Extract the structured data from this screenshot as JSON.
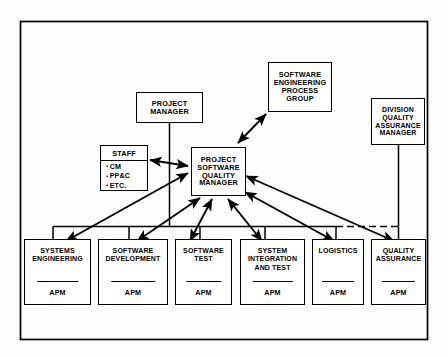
{
  "diagram": {
    "frame": {
      "stroke": "#000000",
      "background": "#fdfdfb"
    },
    "nodes": {
      "project_manager": {
        "label": "PROJECT MANAGER",
        "lines": [
          "PROJECT",
          "MANAGER"
        ]
      },
      "sepg": {
        "label": "SOFTWARE ENGINEERING PROCESS GROUP",
        "lines": [
          "SOFTWARE",
          "ENGINEERING",
          "PROCESS",
          "GROUP"
        ]
      },
      "division_qa": {
        "label": "DIVISION QUALITY ASSURANCE MANAGER",
        "lines": [
          "DIVISION",
          "QUALITY",
          "ASSURANCE",
          "MANAGER"
        ]
      },
      "staff": {
        "title": "STAFF",
        "items": [
          "CM",
          "PP&C",
          "ETC."
        ],
        "bullet": "•"
      },
      "psqm": {
        "label": "PROJECT SOFTWARE QUALITY MANAGER",
        "lines": [
          "PROJECT",
          "SOFTWARE",
          "QUALITY",
          "MANAGER"
        ]
      }
    },
    "leaves": [
      {
        "id": "systems-engineering",
        "lines": [
          "SYSTEMS",
          "ENGINEERING"
        ],
        "role": "APM"
      },
      {
        "id": "software-development",
        "lines": [
          "SOFTWARE",
          "DEVELOPMENT"
        ],
        "role": "APM"
      },
      {
        "id": "software-test",
        "lines": [
          "SOFTWARE",
          "TEST"
        ],
        "role": "APM"
      },
      {
        "id": "system-integration",
        "lines": [
          "SYSTEM",
          "INTEGRATION",
          "AND  TEST"
        ],
        "role": "APM"
      },
      {
        "id": "logistics",
        "lines": [
          "LOGISTICS"
        ],
        "role": "APM"
      },
      {
        "id": "quality-assurance",
        "lines": [
          "QUALITY",
          "ASSURANCE"
        ],
        "role": "APM"
      }
    ],
    "connectors": {
      "bus_style": "solid-with-dashed-right-segment",
      "arrow_style": "double-headed",
      "links": [
        {
          "from": "project_manager",
          "to": "org-bus",
          "type": "line"
        },
        {
          "from": "division_qa",
          "to": "org-bus",
          "type": "line"
        },
        {
          "from": "psqm",
          "to": "sepg",
          "type": "double-arrow"
        },
        {
          "from": "psqm",
          "to": "staff",
          "type": "double-arrow"
        },
        {
          "from": "psqm",
          "to": "systems-engineering",
          "type": "double-arrow"
        },
        {
          "from": "psqm",
          "to": "software-development",
          "type": "double-arrow"
        },
        {
          "from": "psqm",
          "to": "software-test",
          "type": "double-arrow"
        },
        {
          "from": "psqm",
          "to": "system-integration",
          "type": "double-arrow"
        },
        {
          "from": "psqm",
          "to": "logistics",
          "type": "double-arrow"
        },
        {
          "from": "psqm",
          "to": "quality-assurance",
          "type": "double-arrow"
        }
      ]
    }
  }
}
